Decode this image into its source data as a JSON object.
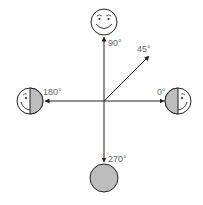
{
  "diagram": {
    "colors": {
      "line": "#222222",
      "shade": "#bdbdbd",
      "face_bg": "#ffffff",
      "label": "#666666"
    },
    "labels": {
      "deg90": "90°",
      "deg45": "45°",
      "deg180": "180°",
      "deg0": "0°",
      "deg270": "270°"
    },
    "faces": [
      {
        "angle": 90,
        "state": "full-lit smiling face"
      },
      {
        "angle": 180,
        "state": "half shaded (right side shaded)"
      },
      {
        "angle": 0,
        "state": "half shaded (left side shaded)"
      },
      {
        "angle": 270,
        "state": "fully shaded"
      }
    ]
  }
}
